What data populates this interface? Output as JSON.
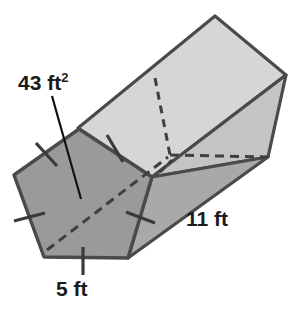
{
  "figure": {
    "shape": "pentagonal-prism",
    "labels": {
      "area": "43 ft",
      "area_exponent": "2",
      "area_full": "43 ft2",
      "length": "11 ft",
      "side": "5 ft"
    },
    "colors": {
      "front_face": "#9a9a9a",
      "top_face": "#d6d6d6",
      "upper_side_face": "#c9c9c9",
      "lower_side_face": "#a9a9a9",
      "edge": "#4a4a4a",
      "hidden_edge": "#4a4a4a",
      "background": "#ffffff",
      "text": "#1b1b1b",
      "leader_line": "#111111"
    },
    "annotations": {
      "tick_marks": "congruence ticks on each pentagon side",
      "tick_count": 5,
      "hidden_edges": "dashed lines indicating back pentagon face and hidden vertical edge"
    }
  }
}
